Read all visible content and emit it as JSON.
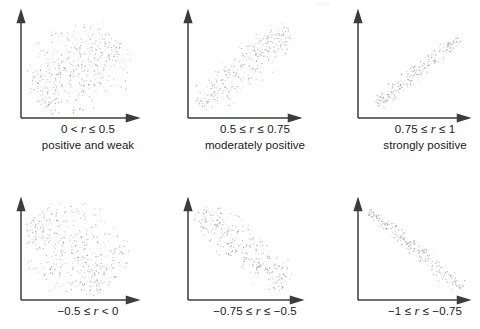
{
  "figure": {
    "title": "",
    "background_color": "#ffffff",
    "axis_color": "#3c3c3c",
    "point_color": "#9a9a9a",
    "rows": 2,
    "cols": 3
  },
  "panels": [
    {
      "id": "panel-positive-weak",
      "range_label": "0 < r ≤ 0.5",
      "range_prefix": "0 < ",
      "range_symbol": "r",
      "range_suffix": " ≤ 0.5",
      "description": "positive and weak",
      "direction": "positive",
      "strength": "weak",
      "r_min": 0,
      "r_max": 0.5
    },
    {
      "id": "panel-moderately-positive",
      "range_label": "0.5 ≤ r ≤ 0.75",
      "range_prefix": "0.5 ≤ ",
      "range_symbol": "r",
      "range_suffix": " ≤ 0.75",
      "description": "moderately positive",
      "direction": "positive",
      "strength": "moderate",
      "r_min": 0.5,
      "r_max": 0.75
    },
    {
      "id": "panel-strongly-positive",
      "range_label": "0.75 ≤ r ≤ 1",
      "range_prefix": "0.75 ≤ ",
      "range_symbol": "r",
      "range_suffix": " ≤ 1",
      "description": "strongly positive",
      "direction": "positive",
      "strength": "strong",
      "r_min": 0.75,
      "r_max": 1
    },
    {
      "id": "panel-negative-weak",
      "range_label": "−0.5 ≤ r < 0",
      "range_prefix": "−0.5 ≤ ",
      "range_symbol": "r",
      "range_suffix": " < 0",
      "description": "",
      "direction": "negative",
      "strength": "weak",
      "r_min": -0.5,
      "r_max": 0
    },
    {
      "id": "panel-moderately-negative",
      "range_label": "−0.75 ≤ r ≤ −0.5",
      "range_prefix": "−0.75 ≤ ",
      "range_symbol": "r",
      "range_suffix": " ≤ −0.5",
      "description": "",
      "direction": "negative",
      "strength": "moderate",
      "r_min": -0.75,
      "r_max": -0.5
    },
    {
      "id": "panel-strongly-negative",
      "range_label": "−1 ≤ r ≤ −0.75",
      "range_prefix": "−1 ≤ ",
      "range_symbol": "r",
      "range_suffix": " ≤ −0.75",
      "description": "",
      "direction": "negative",
      "strength": "strong",
      "r_min": -1,
      "r_max": -0.75
    }
  ],
  "chart_data": {
    "type": "scatter",
    "title": "",
    "xlabel": "",
    "ylabel": "",
    "grid": false,
    "legend": null,
    "axis_style": "arrow-axes-bottom-left",
    "panel_count": 6,
    "subplots": [
      {
        "name": "0 < r ≤ 0.5",
        "caption": "positive and weak",
        "slope": 0.62,
        "correlation_estimate": 0.42,
        "n_points": 420,
        "spread": 0.4,
        "xlim": [
          0,
          1
        ],
        "ylim": [
          0,
          1
        ],
        "cloud_center": [
          0.48,
          0.5
        ],
        "cloud_extent": [
          0.78,
          0.62
        ]
      },
      {
        "name": "0.5 ≤ r ≤ 0.75",
        "caption": "moderately positive",
        "slope": 0.95,
        "correlation_estimate": 0.65,
        "n_points": 300,
        "spread": 0.17,
        "xlim": [
          0,
          1
        ],
        "ylim": [
          0,
          1
        ],
        "cloud_center": [
          0.5,
          0.5
        ],
        "cloud_extent": [
          0.82,
          0.8
        ]
      },
      {
        "name": "0.75 ≤ r ≤ 1",
        "caption": "strongly positive",
        "slope": 0.92,
        "correlation_estimate": 0.9,
        "n_points": 230,
        "spread": 0.07,
        "xlim": [
          0,
          1
        ],
        "ylim": [
          0,
          1
        ],
        "cloud_center": [
          0.52,
          0.46
        ],
        "cloud_extent": [
          0.76,
          0.7
        ]
      },
      {
        "name": "−0.5 ≤ r < 0",
        "caption": "",
        "slope": -0.62,
        "correlation_estimate": -0.42,
        "n_points": 420,
        "spread": 0.4,
        "xlim": [
          0,
          1
        ],
        "ylim": [
          0,
          1
        ],
        "cloud_center": [
          0.45,
          0.5
        ],
        "cloud_extent": [
          0.76,
          0.64
        ]
      },
      {
        "name": "−0.75 ≤ r ≤ −0.5",
        "caption": "",
        "slope": -0.9,
        "correlation_estimate": -0.65,
        "n_points": 300,
        "spread": 0.17,
        "xlim": [
          0,
          1
        ],
        "ylim": [
          0,
          1
        ],
        "cloud_center": [
          0.48,
          0.52
        ],
        "cloud_extent": [
          0.8,
          0.78
        ]
      },
      {
        "name": "−1 ≤ r ≤ −0.75",
        "caption": "",
        "slope": -0.95,
        "correlation_estimate": -0.9,
        "n_points": 230,
        "spread": 0.07,
        "xlim": [
          0,
          1
        ],
        "ylim": [
          0,
          1
        ],
        "cloud_center": [
          0.5,
          0.5
        ],
        "cloud_extent": [
          0.86,
          0.82
        ]
      }
    ]
  }
}
